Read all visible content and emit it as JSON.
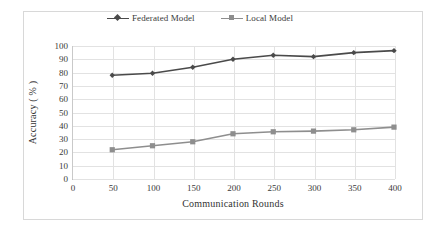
{
  "chart_data": {
    "type": "line",
    "title": "",
    "xlabel": "Communication Rounds",
    "ylabel": "Accuracy ( % )",
    "x": [
      50,
      100,
      150,
      200,
      250,
      300,
      350,
      400
    ],
    "xlim": [
      0,
      400
    ],
    "ylim": [
      0,
      100
    ],
    "xticks": [
      "0",
      "50",
      "100",
      "150",
      "200",
      "250",
      "300",
      "350",
      "400"
    ],
    "xtick_values": [
      0,
      50,
      100,
      150,
      200,
      250,
      300,
      350,
      400
    ],
    "yticks": [
      "0",
      "10",
      "20",
      "30",
      "40",
      "50",
      "60",
      "70",
      "80",
      "90",
      "100"
    ],
    "ytick_values": [
      0,
      10,
      20,
      30,
      40,
      50,
      60,
      70,
      80,
      90,
      100
    ],
    "grid": true,
    "legend_position": "top-center",
    "series": [
      {
        "name": "Federated Model",
        "values": [
          78,
          79.5,
          84,
          90,
          93,
          92,
          95,
          96.5
        ],
        "color": "#4a4a4a",
        "marker": "diamond"
      },
      {
        "name": "Local Model",
        "values": [
          22,
          25,
          28,
          34,
          35.5,
          36,
          37,
          39
        ],
        "color": "#8e8e8e",
        "marker": "square"
      }
    ]
  },
  "legend": {
    "items": [
      {
        "label": "Federated Model",
        "color": "#4a4a4a",
        "marker": "diamond"
      },
      {
        "label": "Local Model",
        "color": "#8e8e8e",
        "marker": "square"
      }
    ]
  },
  "colors": {
    "federated": "#4a4a4a",
    "local": "#8e8e8e",
    "grid": "#e2e2e2",
    "axis": "#b9b9b9",
    "frame": "#d8d8d8",
    "text": "#3a3a3a"
  }
}
